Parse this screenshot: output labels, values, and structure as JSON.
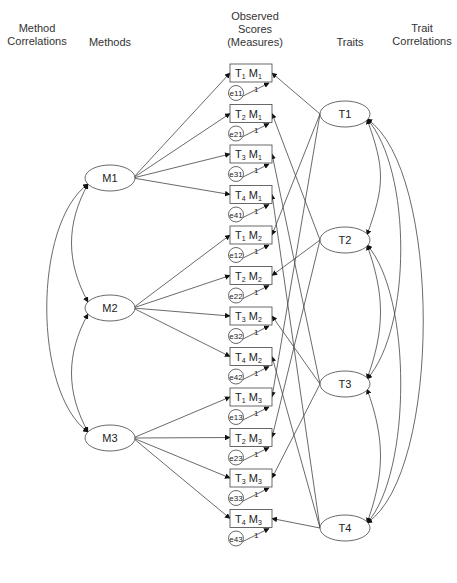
{
  "headers": {
    "method_correlations": "Method\nCorrelations",
    "methods": "Methods",
    "observed_scores": "Observed\nScores\n(Measures)",
    "traits": "Traits",
    "trait_correlations": "Trait\nCorrelations"
  },
  "methods": [
    "M1",
    "M2",
    "M3"
  ],
  "traits": [
    "T1",
    "T2",
    "T3",
    "T4"
  ],
  "measures": [
    {
      "t": "1",
      "m": "1",
      "err": "e11",
      "load": "1"
    },
    {
      "t": "2",
      "m": "1",
      "err": "e21",
      "load": "1"
    },
    {
      "t": "3",
      "m": "1",
      "err": "e31",
      "load": "1"
    },
    {
      "t": "4",
      "m": "1",
      "err": "e41",
      "load": "1"
    },
    {
      "t": "1",
      "m": "2",
      "err": "e12",
      "load": "1"
    },
    {
      "t": "2",
      "m": "2",
      "err": "e22",
      "load": "1"
    },
    {
      "t": "3",
      "m": "2",
      "err": "e32",
      "load": "1"
    },
    {
      "t": "4",
      "m": "2",
      "err": "e42",
      "load": "1"
    },
    {
      "t": "1",
      "m": "3",
      "err": "e13",
      "load": "1"
    },
    {
      "t": "2",
      "m": "3",
      "err": "e23",
      "load": "1"
    },
    {
      "t": "3",
      "m": "3",
      "err": "e33",
      "load": "1"
    },
    {
      "t": "4",
      "m": "3",
      "err": "e43",
      "load": "1"
    }
  ],
  "colors": {
    "line": "#444444",
    "text": "#222222"
  }
}
